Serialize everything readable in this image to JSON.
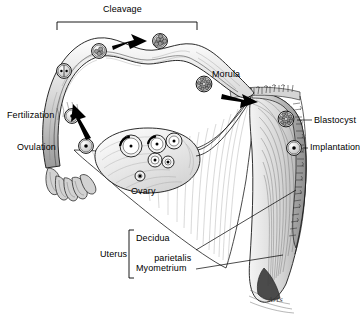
{
  "figure": {
    "background_color": "#ffffff",
    "ink_color": "#000000",
    "tone_color": "#b9b9b9",
    "signature": "Arts"
  },
  "labels": {
    "cleavage": "Cleavage",
    "morula": "Morula",
    "fertilization": "Fertilization",
    "ovulation": "Ovulation",
    "ovary": "Ovary",
    "blastocyst": "Blastocyst",
    "implantation": "Implantation",
    "uterus": "Uterus",
    "decidua_line1": "Decidua",
    "decidua_line2": "parietalis",
    "myometrium": "Myometrium"
  },
  "stages": [
    {
      "name": "ovulated-ovum",
      "label_ref": "ovulation",
      "cells": 1,
      "x": 86,
      "y": 146
    },
    {
      "name": "fertilized-ovum",
      "label_ref": "fertilization",
      "cells": 1,
      "x": 72,
      "y": 116
    },
    {
      "name": "two-cell-stage",
      "cells": 2,
      "x": 64,
      "y": 71
    },
    {
      "name": "four-cell-stage",
      "cells": 4,
      "x": 99,
      "y": 51
    },
    {
      "name": "eight-cell-stage",
      "cells": 8,
      "x": 160,
      "y": 41
    },
    {
      "name": "morula-stage",
      "label_ref": "morula",
      "cells": 16,
      "x": 204,
      "y": 84
    },
    {
      "name": "blastocyst-stage",
      "label_ref": "blastocyst",
      "cells": 32,
      "x": 286,
      "y": 119
    },
    {
      "name": "implanting-blastocyst",
      "label_ref": "implantation",
      "cells": 1,
      "x": 294,
      "y": 148
    }
  ],
  "ovarian_follicles": [
    {
      "name": "primary-follicle",
      "x": 140,
      "y": 176,
      "r": 5
    },
    {
      "name": "secondary-follicle",
      "x": 155,
      "y": 160,
      "r": 7
    },
    {
      "name": "tertiary-follicle",
      "x": 157,
      "y": 144,
      "r": 9
    },
    {
      "name": "graafian-follicle",
      "x": 131,
      "y": 146,
      "r": 11
    },
    {
      "name": "maturing-follicle-a",
      "x": 174,
      "y": 141,
      "r": 8
    },
    {
      "name": "maturing-follicle-b",
      "x": 168,
      "y": 162,
      "r": 6
    }
  ],
  "brackets": {
    "cleavage": {
      "x1": 57,
      "x2": 197,
      "y": 22,
      "drop": 8
    },
    "uterus": {
      "x": 129,
      "y1": 230,
      "y2": 278,
      "tick": 5
    }
  },
  "leaders": [
    {
      "name": "blastocyst-leader",
      "x1": 297,
      "y1": 120,
      "x2": 312,
      "y2": 120
    },
    {
      "name": "implantation-leader",
      "x1": 303,
      "y1": 148,
      "x2": 308,
      "y2": 148
    },
    {
      "name": "decidua-leader",
      "x1": 196,
      "y1": 250,
      "x2": 296,
      "y2": 190
    },
    {
      "name": "myometrium-leader",
      "x1": 196,
      "y1": 269,
      "x2": 283,
      "y2": 255
    }
  ],
  "label_positions": {
    "cleavage": {
      "x": 103,
      "y": 4
    },
    "morula": {
      "x": 212,
      "y": 69
    },
    "fertilization": {
      "x": 7,
      "y": 110
    },
    "ovulation": {
      "x": 17,
      "y": 142
    },
    "ovary": {
      "x": 131,
      "y": 186
    },
    "blastocyst": {
      "x": 314,
      "y": 115
    },
    "implantation": {
      "x": 310,
      "y": 142
    },
    "uterus": {
      "x": 100,
      "y": 249
    },
    "decidua": {
      "x": 136,
      "y": 233
    },
    "myometrium": {
      "x": 136,
      "y": 263
    }
  }
}
